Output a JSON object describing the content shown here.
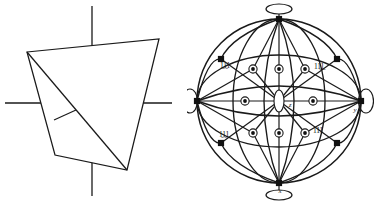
{
  "figure": {
    "title": "",
    "background_color": "#ffffff",
    "line_color": "#1a1a1a",
    "width": 374,
    "height": 206,
    "panels": [
      {
        "id": "left",
        "name": "tetrahedron-perspective",
        "description": "Tetrahedron drawn in perspective with three crossing axis lines"
      },
      {
        "id": "right",
        "name": "stereographic-projection",
        "description": "Stereographic projection with great-circle arcs, pole markers and two-fold axis lens symbols"
      }
    ]
  },
  "left_panel": {
    "name": "tetrahedron-diagram",
    "axis_lines": [
      {
        "name": "vertical-axis-line",
        "label": ""
      },
      {
        "name": "horizontal-axis-line",
        "label": ""
      }
    ],
    "shape": {
      "name": "tetrahedron-outline",
      "vertices": [
        {
          "id": "top-left",
          "x": 27,
          "y": 52
        },
        {
          "id": "top-right",
          "x": 159,
          "y": 39
        },
        {
          "id": "bottom-right",
          "x": 127,
          "y": 170
        },
        {
          "id": "bottom-left",
          "x": 55,
          "y": 155
        }
      ],
      "edges": [
        "top-left -> top-right",
        "top-right -> bottom-right",
        "bottom-right -> bottom-left",
        "bottom-left -> top-left",
        "top-left -> bottom-right"
      ],
      "tick_mark": {
        "name": "edge-tick-mark",
        "x1": 54,
        "y1": 120,
        "x2": 76,
        "y2": 110
      }
    }
  },
  "right_panel": {
    "name": "stereogram-diagram",
    "outer_circle": {
      "cx": 92,
      "cy": 101,
      "r": 82
    },
    "axis_labels": [
      {
        "id": "y-axis",
        "text": "y",
        "x": 168,
        "y": 112
      },
      {
        "id": "x-axis",
        "text": "x",
        "x": 93,
        "y": 193
      },
      {
        "id": "z-axis",
        "text": "z",
        "x": 101,
        "y": 106
      }
    ],
    "miller_labels": [
      {
        "id": "pole-upper-left",
        "text": "1̱1̱1",
        "x": 38,
        "y": 68
      },
      {
        "id": "pole-upper-right",
        "text": "11̱1̱",
        "x": 121,
        "y": 69
      },
      {
        "id": "pole-lower-left",
        "text": "1̱1̱1",
        "x": 37,
        "y": 137
      },
      {
        "id": "pole-lower-right",
        "text": "111",
        "x": 124,
        "y": 133
      }
    ],
    "markers": {
      "filled_square": {
        "name": "filled-square-pole",
        "count": 10,
        "description": "Solid square poles on the primitive circle and diagonal positions"
      },
      "circled_dot": {
        "name": "circled-dot-pole",
        "count": 9,
        "description": "Dot inside small circle marking mirror-plane poles"
      },
      "lens": {
        "name": "two-fold-axis-lens",
        "count": 4,
        "description": "Lens/ellipse symbol marking two-fold rotation axes at the projection edge"
      }
    },
    "axis_stubs": [
      {
        "id": "north-stub"
      },
      {
        "id": "south-stub"
      },
      {
        "id": "east-stub"
      },
      {
        "id": "west-stub"
      }
    ]
  }
}
